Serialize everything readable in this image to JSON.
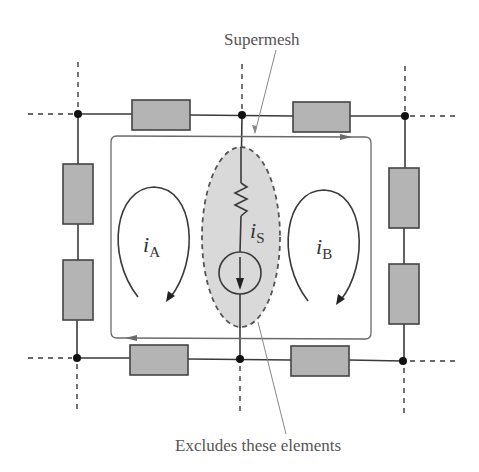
{
  "diagram": {
    "title_labels": {
      "supermesh": "Supermesh",
      "excludes": "Excludes these elements"
    },
    "mesh_currents": [
      {
        "id": "A",
        "symbol": "i",
        "subscript": "A",
        "direction": "clockwise"
      },
      {
        "id": "B",
        "symbol": "i",
        "subscript": "B",
        "direction": "clockwise"
      }
    ],
    "source": {
      "symbol": "i",
      "subscript": "S",
      "type": "current-source",
      "direction": "down"
    },
    "colors": {
      "resistor_fill": "#b4b4b4",
      "exclusion_fill": "#d9d9d9",
      "wire": "#3a3a3a",
      "label": "#555555"
    },
    "components": {
      "resistors_block": 8,
      "resistor_zigzag": 1,
      "current_sources": 1,
      "nodes": 6
    }
  }
}
